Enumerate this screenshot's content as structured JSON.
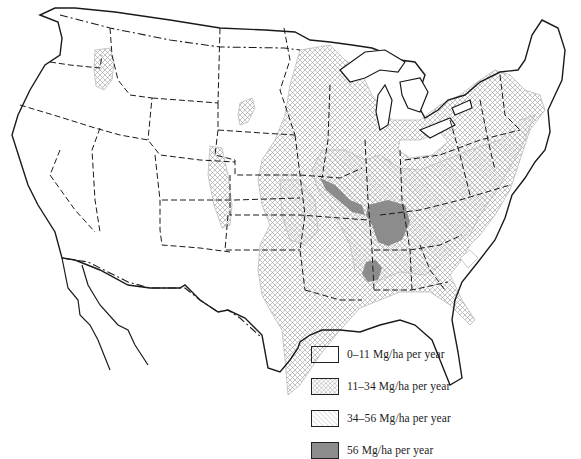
{
  "map": {
    "subject": "Continental United States",
    "colors": {
      "outline": "#1a1a1a",
      "hatch": "#9a9a9a",
      "shaded": "#8c8c8c",
      "background": "#ffffff"
    }
  },
  "legend": {
    "items": [
      {
        "label": "0–11 Mg/ha per year",
        "pattern": "none"
      },
      {
        "label": "11–34 Mg/ha per year",
        "pattern": "crosshatch"
      },
      {
        "label": "34–56 Mg/ha per year",
        "pattern": "diagonal"
      },
      {
        "label": "56 Mg/ha per year",
        "pattern": "solid-gray"
      }
    ]
  }
}
